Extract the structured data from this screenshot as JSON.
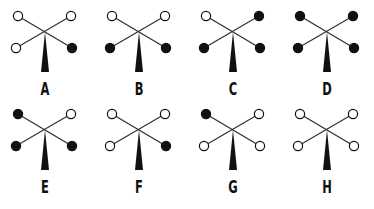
{
  "figure_set": {
    "description": "Eight arrangements of four dots on an X shape with a center spike",
    "figures": [
      {
        "label": "A",
        "top_left": "open",
        "top_right": "open",
        "bottom_left": "open",
        "bottom_right": "filled"
      },
      {
        "label": "B",
        "top_left": "open",
        "top_right": "open",
        "bottom_left": "filled",
        "bottom_right": "filled"
      },
      {
        "label": "C",
        "top_left": "open",
        "top_right": "filled",
        "bottom_left": "filled",
        "bottom_right": "filled"
      },
      {
        "label": "D",
        "top_left": "filled",
        "top_right": "filled",
        "bottom_left": "filled",
        "bottom_right": "filled"
      },
      {
        "label": "E",
        "top_left": "filled",
        "top_right": "open",
        "bottom_left": "filled",
        "bottom_right": "filled"
      },
      {
        "label": "F",
        "top_left": "open",
        "top_right": "open",
        "bottom_left": "open",
        "bottom_right": "filled"
      },
      {
        "label": "G",
        "top_left": "filled",
        "top_right": "open",
        "bottom_left": "open",
        "bottom_right": "open"
      },
      {
        "label": "H",
        "top_left": "open",
        "top_right": "open",
        "bottom_left": "open",
        "bottom_right": "open"
      }
    ]
  },
  "colors": {
    "ink": "#111111",
    "background": "#ffffff"
  }
}
